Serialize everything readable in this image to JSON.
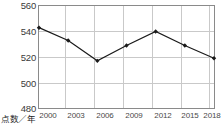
{
  "chart_data": {
    "type": "line",
    "title": "",
    "xlabel": "年",
    "ylabel": "点数",
    "axis_corner_label": "点数／年",
    "categories": [
      "2000",
      "2003",
      "2006",
      "2009",
      "2012",
      "2015",
      "2018"
    ],
    "values": [
      543,
      533,
      517,
      529,
      540,
      529,
      519
    ],
    "ylim": [
      480,
      560
    ],
    "yticks": [
      "480",
      "500",
      "520",
      "540",
      "560"
    ],
    "ytick_values": [
      480,
      500,
      520,
      540,
      560
    ],
    "grid": true,
    "legend": "none",
    "series": [
      {
        "name": "点数",
        "values": [
          543,
          533,
          517,
          529,
          540,
          529,
          519
        ],
        "marker": "diamond",
        "color": "#1a1a1a"
      }
    ]
  },
  "style": {
    "line_color": "#1a1a1a",
    "marker_color": "#1a1a1a",
    "grid_color": "#c9c9c9",
    "frame_color": "#8a8a8a",
    "tick_text_color": "#3a3a3a",
    "background": "#ffffff"
  }
}
